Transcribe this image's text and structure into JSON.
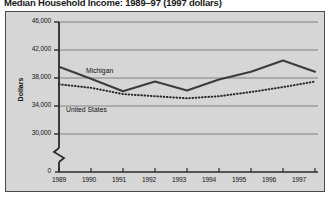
{
  "figure": {
    "title": "Median Household Income: 1989–97 (1997 dollars)",
    "background_color": "#ffffff",
    "panel_color": "#d6d6d6",
    "border_color": "#4a4a4a"
  },
  "axes": {
    "ylabel": "Dollars",
    "yticks": [
      "46,000",
      "42,000",
      "38,000",
      "34,000",
      "30,000",
      "0"
    ],
    "xticks": [
      "1989",
      "1990",
      "1991",
      "1992",
      "1993",
      "1994",
      "1995",
      "1996",
      "1997"
    ],
    "axis_break": "zigzag-break"
  },
  "series_labels": {
    "michigan": "Michigan",
    "united_states": "United States"
  },
  "chart_data": {
    "type": "line",
    "title": "Median Household Income: 1989–97 (1997 dollars)",
    "xlabel": "",
    "ylabel": "Dollars",
    "x": [
      1989,
      1990,
      1991,
      1992,
      1993,
      1994,
      1995,
      1996,
      1997
    ],
    "categories": [
      "1989",
      "1990",
      "1991",
      "1992",
      "1993",
      "1994",
      "1995",
      "1996",
      "1997"
    ],
    "ylim": [
      30000,
      46000
    ],
    "ytick_values": [
      46000,
      42000,
      38000,
      34000,
      30000,
      0
    ],
    "y_axis_break_between": [
      0,
      30000
    ],
    "grid": "horizontal",
    "legend": "inline-labels",
    "series": [
      {
        "name": "Michigan",
        "style": "solid",
        "color": "#3c3c3c",
        "values": [
          39600,
          37900,
          36100,
          37500,
          36200,
          37800,
          38900,
          40500,
          38900
        ]
      },
      {
        "name": "United States",
        "style": "dotted",
        "color": "#2a2a2a",
        "values": [
          37100,
          36600,
          35700,
          35400,
          35100,
          35400,
          36000,
          36700,
          37500
        ]
      }
    ]
  }
}
